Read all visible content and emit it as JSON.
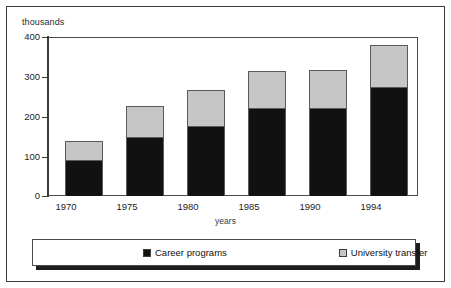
{
  "chart_data": {
    "type": "bar",
    "subtype": "stacked-vertical",
    "title": "",
    "xlabel": "years",
    "ylabel": "thousands",
    "categories": [
      "1970",
      "1975",
      "1980",
      "1985",
      "1990",
      "1994"
    ],
    "series": [
      {
        "name": "Career programs",
        "color": "#111111",
        "values": [
          90,
          148,
          176,
          221,
          221,
          274
        ]
      },
      {
        "name": "University transfer",
        "color": "#c6c6c6",
        "values": [
          48,
          78,
          91,
          93,
          96,
          106
        ]
      }
    ],
    "totals": [
      138,
      226,
      267,
      314,
      317,
      380
    ],
    "ylim": [
      0,
      400
    ],
    "yticks": [
      0,
      100,
      200,
      300,
      400
    ],
    "ytick_labels": [
      "0",
      "100",
      "200",
      "300",
      "400"
    ],
    "grid": "horizontal",
    "legend_position": "bottom"
  },
  "axes": {
    "y_title": "thousands",
    "x_title": "years",
    "y_ticks": [
      {
        "label": "400",
        "value": 400
      },
      {
        "label": "300",
        "value": 300
      },
      {
        "label": "200",
        "value": 200
      },
      {
        "label": "100",
        "value": 100
      },
      {
        "label": "0",
        "value": 0
      }
    ],
    "x_ticks": [
      "1970",
      "1975",
      "1980",
      "1985",
      "1990",
      "1994"
    ]
  },
  "legend": {
    "items": [
      {
        "label": "Career programs",
        "swatch": "#111111"
      },
      {
        "label": "University transfer",
        "swatch": "#c6c6c6"
      }
    ]
  },
  "colors": {
    "career_programs": "#111111",
    "university_transfer": "#c6c6c6",
    "frame": "#3a3a3a",
    "gridline": "#9a9a9a",
    "background": "#ffffff"
  }
}
